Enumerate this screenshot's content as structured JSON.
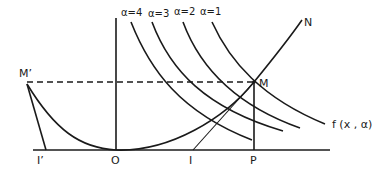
{
  "diagram": {
    "curve_labels": [
      "α=4",
      "α=3",
      "α=2",
      "α=1"
    ],
    "curve_family_label": "f (x , α)",
    "points": {
      "M": "M",
      "M_prime": "M’",
      "N": "N",
      "O": "O",
      "I": "I",
      "I_prime": "I’",
      "P": "P"
    },
    "colors": {
      "ink": "#1a1a1a",
      "background": "#ffffff"
    }
  }
}
